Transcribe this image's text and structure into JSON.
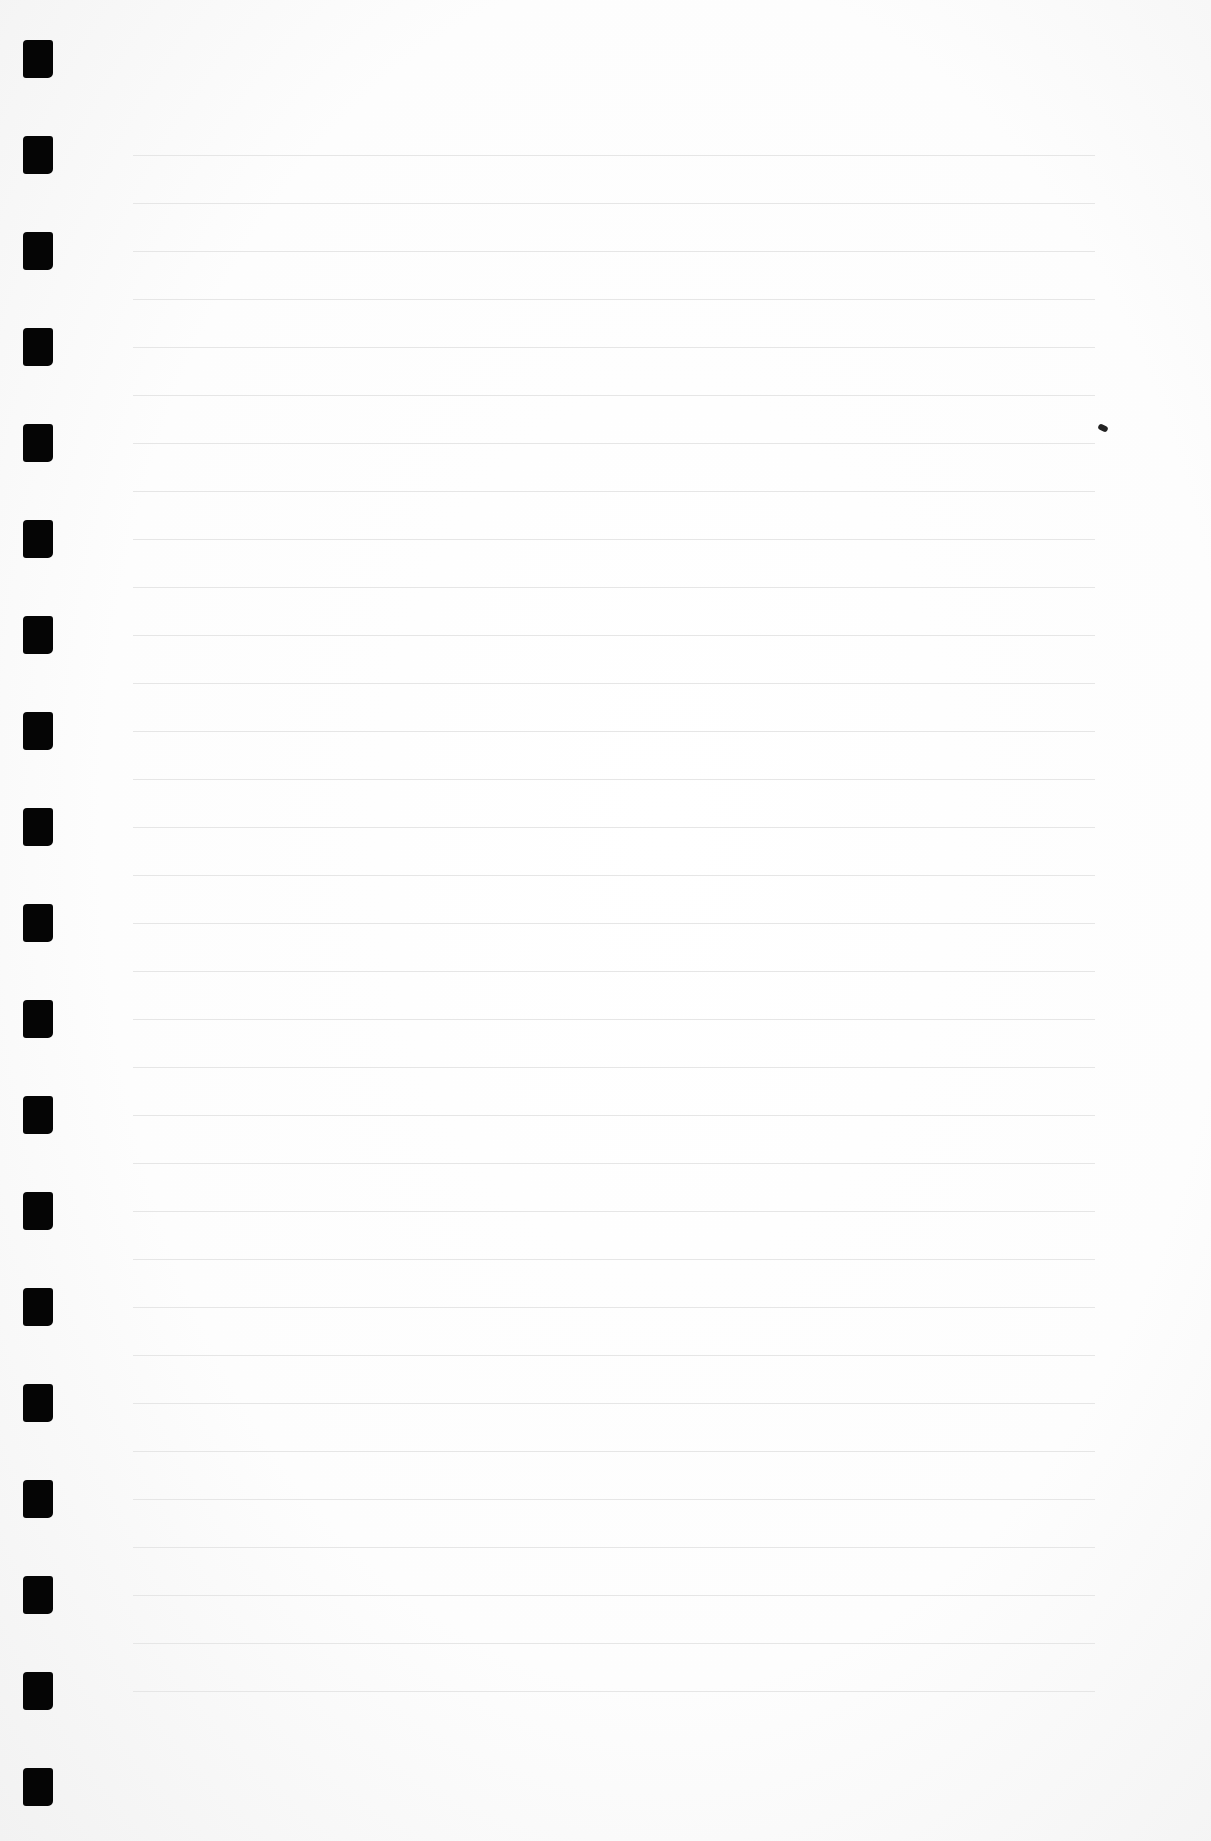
{
  "page": {
    "type": "blank ruled notebook page",
    "background_color": "#ffffff",
    "rule_color": "#e6e6e6",
    "hole_color": "#050505"
  },
  "binding_holes": {
    "count": 19,
    "x": 23,
    "width": 30,
    "height": 38,
    "first_top": 40,
    "spacing": 96
  },
  "ruled_lines": {
    "count": 33,
    "x_start": 133,
    "x_end": 1095,
    "first_y": 155,
    "spacing": 48
  },
  "marks": [
    {
      "name": "ink-speck",
      "x": 1098,
      "y": 425
    }
  ]
}
